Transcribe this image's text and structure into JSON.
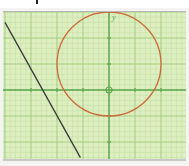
{
  "figure": {
    "type": "coordinate-plane",
    "axis_label_y": "y",
    "origin_marker": "small-circle",
    "colors": {
      "paper": "#ddeec0",
      "fine_grid": "#c3dfa0",
      "major_grid": "#9fca7c",
      "axis": "#5ea84f",
      "circle": "#cc6a3a",
      "line": "#3a3a3a"
    },
    "unit_px": 26,
    "origin_px": [
      106,
      78
    ],
    "x_ticks": [
      -3,
      -2,
      -1,
      1,
      2,
      3
    ],
    "y_ticks": [
      -2,
      -1,
      1,
      2
    ]
  },
  "shapes": {
    "circle": {
      "center": [
        0,
        1
      ],
      "radius": 2,
      "label": "circle centered (0,1), r=2"
    },
    "line": {
      "from": [
        -4,
        2.6
      ],
      "to": [
        -1.1,
        -2.6
      ],
      "label": "straight line with negative slope"
    }
  }
}
